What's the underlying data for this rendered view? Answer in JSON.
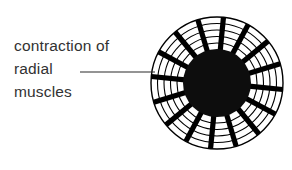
{
  "figure": {
    "title": "contraction of radial muscles",
    "background_color": "#ffffff",
    "ink_color": "#000000",
    "text_color": "#323232"
  },
  "annotation": {
    "lines": [
      "contraction of",
      "radial",
      "muscles"
    ],
    "leader_line": {
      "from_x": 80,
      "to_x": 155,
      "y": 72
    }
  },
  "diagram": {
    "name": "dilated-iris-radial-muscles",
    "center_x": 217,
    "center_y": 83,
    "outer_radius": 66,
    "pupil_radius": 34,
    "pupil_color": "#0d0d0d",
    "ring_count": 5,
    "ring_radii": [
      66,
      59.5,
      53,
      46.5,
      40
    ],
    "spoke_count": 16,
    "spoke_width": 5.2,
    "ring_stroke_width": 1.1
  }
}
